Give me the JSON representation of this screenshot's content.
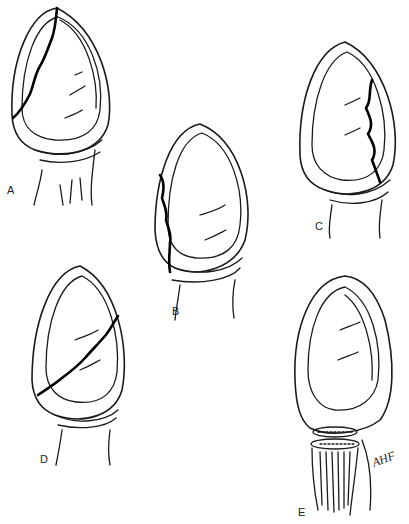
{
  "figure": {
    "panels": [
      {
        "id": "A",
        "label": "A",
        "description": "Ovoid organ with fracture line from apex down the left side"
      },
      {
        "id": "B",
        "label": "B",
        "description": "Ovoid organ with vertical fracture along left lower pole"
      },
      {
        "id": "C",
        "label": "C",
        "description": "Ovoid organ with vertical fracture along right side"
      },
      {
        "id": "D",
        "label": "D",
        "description": "Ovoid organ with oblique transverse fracture across middle"
      },
      {
        "id": "E",
        "label": "E",
        "description": "Ovoid organ with transected cord at base, showing cut section"
      }
    ],
    "signature": "AHF",
    "colors": {
      "line": "#1a1a1a",
      "fracture": "#000000",
      "background": "#ffffff"
    }
  }
}
